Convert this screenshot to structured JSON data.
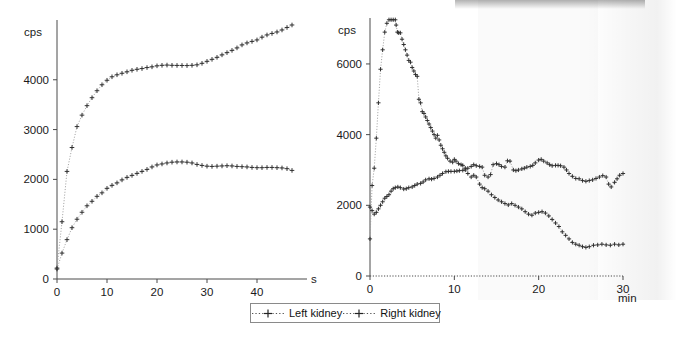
{
  "figure": {
    "background": "#ffffff",
    "marker_color": "#2b2b2b",
    "line_color": "#9a9a9a"
  },
  "legend": {
    "name": "series-legend",
    "items": [
      {
        "label": "Left kidney",
        "marker": "plus-dotted-marker",
        "color": "#2b2b2b"
      },
      {
        "label": "Right kidney",
        "marker": "plus-dotted-marker",
        "color": "#2b2b2b"
      }
    ]
  },
  "panels": {
    "left": {
      "ylabel": "cps",
      "xlabel": "s",
      "xticks": [
        "0",
        "10",
        "20",
        "30",
        "40"
      ],
      "yticks": [
        "0",
        "1000",
        "2000",
        "3000",
        "4000"
      ]
    },
    "right": {
      "ylabel": "cps",
      "xlabel": "min",
      "xticks": [
        "0",
        "10",
        "20",
        "30"
      ],
      "yticks": [
        "0",
        "2000",
        "4000",
        "6000"
      ]
    }
  },
  "chart_data": [
    {
      "type": "line",
      "id": "left-panel-renogram",
      "title": "",
      "xlabel": "s",
      "ylabel": "cps",
      "xlim": [
        0,
        50
      ],
      "ylim": [
        0,
        5200
      ],
      "xticks": [
        0,
        10,
        20,
        30,
        40
      ],
      "yticks": [
        0,
        1000,
        2000,
        3000,
        4000
      ],
      "grid": false,
      "legend_position": "below-figure",
      "series": [
        {
          "name": "Left kidney",
          "x": [
            0,
            1,
            2,
            3,
            4,
            5,
            6,
            7,
            8,
            9,
            10,
            11,
            12,
            13,
            14,
            15,
            16,
            17,
            18,
            19,
            20,
            21,
            22,
            23,
            24,
            25,
            26,
            27,
            28,
            29,
            30,
            31,
            32,
            33,
            34,
            35,
            36,
            37,
            38,
            39,
            40,
            41,
            42,
            43,
            44,
            45,
            46,
            47
          ],
          "y": [
            220,
            1150,
            2160,
            2640,
            3060,
            3290,
            3480,
            3640,
            3780,
            3900,
            3990,
            4060,
            4100,
            4130,
            4160,
            4190,
            4210,
            4225,
            4245,
            4260,
            4280,
            4290,
            4295,
            4290,
            4288,
            4287,
            4285,
            4290,
            4300,
            4330,
            4370,
            4410,
            4450,
            4500,
            4545,
            4590,
            4640,
            4700,
            4740,
            4770,
            4800,
            4855,
            4900,
            4930,
            4960,
            5000,
            5050,
            5100
          ]
        },
        {
          "name": "Right kidney",
          "x": [
            0,
            1,
            2,
            3,
            4,
            5,
            6,
            7,
            8,
            9,
            10,
            11,
            12,
            13,
            14,
            15,
            16,
            17,
            18,
            19,
            20,
            21,
            22,
            23,
            24,
            25,
            26,
            27,
            28,
            29,
            30,
            31,
            32,
            33,
            34,
            35,
            36,
            37,
            38,
            39,
            40,
            41,
            42,
            43,
            44,
            45,
            46,
            47
          ],
          "y": [
            200,
            520,
            790,
            1030,
            1200,
            1340,
            1470,
            1560,
            1660,
            1730,
            1820,
            1880,
            1930,
            1990,
            2040,
            2080,
            2120,
            2160,
            2200,
            2250,
            2290,
            2310,
            2330,
            2345,
            2350,
            2350,
            2345,
            2330,
            2300,
            2280,
            2265,
            2260,
            2265,
            2270,
            2275,
            2270,
            2260,
            2255,
            2250,
            2240,
            2235,
            2235,
            2240,
            2240,
            2235,
            2230,
            2215,
            2180
          ]
        }
      ]
    },
    {
      "type": "line",
      "id": "right-panel-renogram",
      "title": "",
      "xlabel": "min",
      "ylabel": "cps",
      "xlim": [
        0,
        30
      ],
      "ylim": [
        0,
        7300
      ],
      "xticks": [
        0,
        10,
        20,
        30
      ],
      "yticks": [
        0,
        2000,
        4000,
        6000
      ],
      "grid": false,
      "legend_position": "below-figure",
      "series": [
        {
          "name": "Left kidney",
          "x": [
            0,
            0.25,
            0.5,
            0.75,
            1,
            1.25,
            1.5,
            1.75,
            2,
            2.25,
            2.5,
            2.75,
            3,
            3.1,
            3.25,
            3.4,
            3.6,
            3.8,
            4,
            4.2,
            4.4,
            4.6,
            4.8,
            5,
            5.2,
            5.4,
            5.6,
            5.8,
            6,
            6.2,
            6.4,
            6.6,
            6.8,
            7,
            7.2,
            7.4,
            7.6,
            7.8,
            8,
            8.2,
            8.4,
            8.6,
            8.8,
            9,
            9.2,
            9.5,
            9.8,
            10,
            10.2,
            10.5,
            10.8,
            11,
            11.3,
            11.6,
            12,
            12.3,
            12.6,
            13,
            13.3,
            13.6,
            14,
            14.4,
            14.8,
            15.2,
            15.6,
            16,
            16.4,
            16.8,
            17.2,
            17.6,
            18,
            18.4,
            18.8,
            19.2,
            19.6,
            20,
            20.4,
            20.8,
            21.2,
            21.6,
            22,
            22.4,
            22.8,
            23.2,
            23.6,
            24,
            24.4,
            24.8,
            25.2,
            25.6,
            26,
            26.5,
            27,
            27.5,
            28,
            28.5,
            29,
            29.5,
            30
          ],
          "y": [
            1050,
            2560,
            3050,
            3900,
            4900,
            5850,
            6400,
            6900,
            7150,
            7250,
            7250,
            7250,
            7250,
            7100,
            6900,
            6880,
            6880,
            6700,
            6550,
            6400,
            6250,
            6100,
            6050,
            5900,
            5800,
            5700,
            5650,
            5000,
            4900,
            4650,
            4600,
            4500,
            4400,
            4300,
            4200,
            4100,
            4000,
            3900,
            3980,
            3850,
            3700,
            3600,
            3500,
            3400,
            3330,
            3250,
            3220,
            3300,
            3250,
            3180,
            3150,
            3130,
            3050,
            2900,
            2800,
            2850,
            2800,
            2600,
            2500,
            2470,
            2400,
            2300,
            2220,
            2150,
            2100,
            2050,
            2010,
            2050,
            2000,
            1950,
            1900,
            1820,
            1750,
            1720,
            1780,
            1800,
            1820,
            1780,
            1700,
            1600,
            1500,
            1400,
            1250,
            1150,
            1050,
            950,
            900,
            870,
            830,
            810,
            830,
            870,
            880,
            900,
            880,
            870,
            900,
            880,
            900
          ]
        },
        {
          "name": "Right kidney",
          "x": [
            0,
            0.25,
            0.5,
            0.75,
            1,
            1.25,
            1.5,
            1.75,
            2,
            2.25,
            2.5,
            2.75,
            3,
            3.3,
            3.6,
            4,
            4.3,
            4.6,
            5,
            5.3,
            5.6,
            6,
            6.3,
            6.6,
            7,
            7.3,
            7.6,
            8,
            8.3,
            8.6,
            9,
            9.3,
            9.6,
            10,
            10.3,
            10.6,
            11,
            11.3,
            11.6,
            12,
            12.3,
            12.6,
            13,
            13.3,
            13.6,
            14,
            14.3,
            14.6,
            15,
            15.3,
            15.6,
            16,
            16.3,
            16.6,
            17,
            17.3,
            17.6,
            18,
            18.3,
            18.6,
            19,
            19.3,
            19.6,
            20,
            20.3,
            20.6,
            21,
            21.3,
            21.6,
            22,
            22.3,
            22.6,
            23,
            23.3,
            23.6,
            24,
            24.4,
            24.8,
            25.2,
            25.6,
            26,
            26.4,
            26.8,
            27.2,
            27.6,
            28,
            28.3,
            28.6,
            29,
            29.3,
            29.6,
            30
          ],
          "y": [
            1950,
            1850,
            1750,
            1800,
            1900,
            2000,
            2100,
            2200,
            2250,
            2300,
            2400,
            2470,
            2500,
            2520,
            2500,
            2460,
            2470,
            2500,
            2520,
            2560,
            2600,
            2620,
            2660,
            2720,
            2750,
            2740,
            2760,
            2800,
            2850,
            2900,
            2950,
            2960,
            2960,
            2960,
            2970,
            2980,
            2990,
            3000,
            3050,
            3100,
            3150,
            3120,
            3100,
            3080,
            2850,
            2800,
            2870,
            3150,
            3180,
            3150,
            3100,
            3080,
            3260,
            3250,
            3000,
            2980,
            3000,
            3030,
            3050,
            3080,
            3100,
            3130,
            3200,
            3280,
            3300,
            3250,
            3200,
            3150,
            3120,
            3130,
            3130,
            3120,
            3080,
            3000,
            2900,
            2820,
            2760,
            2750,
            2700,
            2680,
            2700,
            2720,
            2760,
            2800,
            2840,
            2800,
            2600,
            2520,
            2650,
            2750,
            2850,
            2900
          ]
        }
      ]
    }
  ]
}
